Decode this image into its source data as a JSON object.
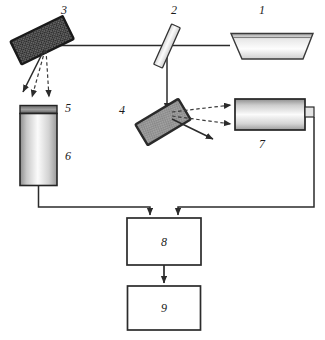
{
  "figure": {
    "type": "optical-schematic",
    "background_color": "#ffffff",
    "line_color": "#2b2b2b",
    "dashed_ray_color": "#3a3a3a"
  },
  "components": [
    {
      "id": "1",
      "label": "1",
      "name": "light-source",
      "shape": "trapezoid",
      "label_x": 262,
      "label_y": 14
    },
    {
      "id": "2",
      "label": "2",
      "name": "beam-splitter",
      "shape": "tilted-slab",
      "label_x": 174,
      "label_y": 14
    },
    {
      "id": "3",
      "label": "3",
      "name": "diffraction-grating-upper",
      "shape": "tilted-hatched-rectangle",
      "fill": "#2e2e2e",
      "label_x": 64,
      "label_y": 14
    },
    {
      "id": "4",
      "label": "4",
      "name": "diffraction-grating-lower",
      "shape": "tilted-hatched-rectangle",
      "fill": "#9a9a9a",
      "label_x": 122,
      "label_y": 114
    },
    {
      "id": "5",
      "label": "5",
      "name": "detector-window-cap",
      "shape": "dark-cap",
      "label_x": 68,
      "label_y": 112
    },
    {
      "id": "6",
      "label": "6",
      "name": "vertical-photodetector",
      "shape": "vertical-cylinder",
      "label_x": 68,
      "label_y": 160
    },
    {
      "id": "7",
      "label": "7",
      "name": "horizontal-photodetector",
      "shape": "horizontal-cylinder",
      "label_x": 262,
      "label_y": 148
    },
    {
      "id": "8",
      "label": "8",
      "name": "signal-processing-unit",
      "shape": "rectangle-box",
      "label_x": 164,
      "label_y": 245
    },
    {
      "id": "9",
      "label": "9",
      "name": "output-display-unit",
      "shape": "rectangle-box",
      "label_x": 164,
      "label_y": 312
    }
  ],
  "beams": {
    "solid_label": "solid beam path",
    "dashed_label": "dashed diffracted ray"
  }
}
